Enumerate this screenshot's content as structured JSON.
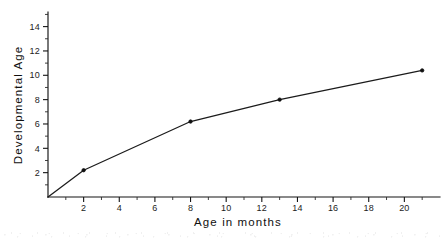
{
  "chart_data": {
    "type": "line",
    "title": "",
    "subtitle": "",
    "xlabel": "Age in months",
    "ylabel": "Developmental Age",
    "xlim": [
      0,
      22
    ],
    "ylim": [
      0,
      15.2
    ],
    "grid": false,
    "legend_position": "none",
    "x": [
      0,
      2,
      8,
      13,
      21
    ],
    "values": [
      0,
      2.2,
      6.2,
      8.0,
      10.4
    ],
    "series": [
      {
        "name": "Developmental Age",
        "x": [
          0,
          2,
          8,
          13,
          21
        ],
        "values": [
          0,
          2.2,
          6.2,
          8.0,
          10.4
        ],
        "marker": "dot",
        "color": "#141414"
      }
    ],
    "x_ticks": [
      2,
      4,
      6,
      8,
      10,
      12,
      14,
      16,
      18,
      20
    ],
    "x_tick_labels": [
      "2",
      "4",
      "6",
      "8",
      "10",
      "12",
      "14",
      "16",
      "18",
      "20"
    ],
    "x_minor_ticks": [
      1,
      3,
      5,
      7,
      9,
      11,
      13,
      15,
      17,
      19,
      21
    ],
    "y_ticks": [
      2,
      4,
      6,
      8,
      10,
      12,
      14
    ],
    "y_tick_labels": [
      "2",
      "4",
      "6",
      "8",
      "10",
      "12",
      "14"
    ],
    "y_minor_ticks": [
      1,
      3,
      5,
      7,
      9,
      11,
      13,
      15
    ],
    "annotations": []
  },
  "colors": {
    "background": "#ffffff",
    "ink": "#141414",
    "line": "#1b1b1b",
    "marker": "#101010"
  }
}
